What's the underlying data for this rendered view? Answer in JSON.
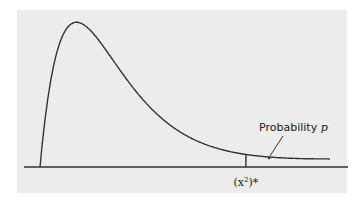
{
  "chart_data": {
    "type": "line",
    "title": "",
    "xlabel": "",
    "ylabel": "",
    "curve": "chi-square density (right-skewed)",
    "critical_value_label": "(x²)*",
    "critical_value_base": "(x",
    "critical_value_sup": "2",
    "critical_value_tail": ")*",
    "annotation": {
      "text_prefix": "Probability ",
      "text_var": "p",
      "points_to": "upper tail area"
    },
    "critical_value_fraction_of_range": 0.71,
    "grid": false,
    "legend": "none"
  },
  "colors": {
    "panel": "#ececec",
    "ink": "#333333"
  }
}
